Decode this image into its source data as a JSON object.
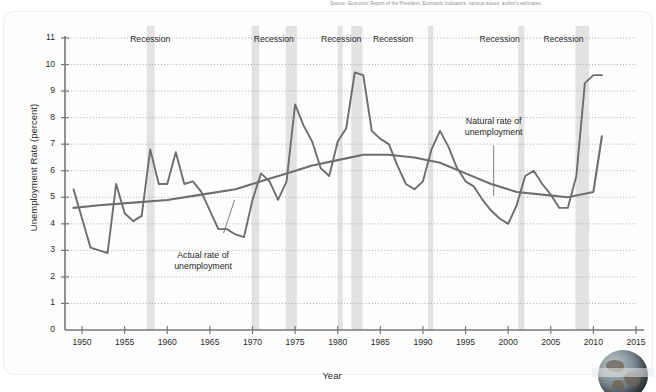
{
  "source_note": "Source: Economic Report of the President, Economic Indicators, various issues; author's estimates.",
  "annotations": {
    "actual": "Actual rate of\nunemployment",
    "actual_line1": "Actual rate of",
    "actual_line2": "unemployment",
    "natural_line1": "Natural rate of",
    "natural_line2": "unemployment"
  },
  "recession_label": "Recession",
  "decor": {
    "globe": "globe-image"
  },
  "chart_data": {
    "type": "line",
    "title": "",
    "xlabel": "Year",
    "ylabel": "Unemployment Rate (percent)",
    "xlim": [
      1948,
      2015
    ],
    "ylim": [
      0,
      11
    ],
    "xticks": [
      1950,
      1955,
      1960,
      1965,
      1970,
      1975,
      1980,
      1985,
      1990,
      1995,
      2000,
      2005,
      2010,
      2015
    ],
    "yticks": [
      0,
      1,
      2,
      3,
      4,
      5,
      6,
      7,
      8,
      9,
      10,
      11
    ],
    "grid": "horizontal-dotted",
    "legend": "none (inline annotations)",
    "colors": {
      "actual": "#6e6e6e",
      "natural": "#6e6e6e",
      "recession_band": "#e2e2e2",
      "grid": "#9a9a9a"
    },
    "series": [
      {
        "name": "Actual rate of unemployment",
        "x": [
          1949,
          1950,
          1951,
          1952,
          1953,
          1954,
          1955,
          1956,
          1957,
          1958,
          1959,
          1960,
          1961,
          1962,
          1963,
          1964,
          1965,
          1966,
          1967,
          1968,
          1969,
          1970,
          1971,
          1972,
          1973,
          1974,
          1975,
          1976,
          1977,
          1978,
          1979,
          1980,
          1981,
          1982,
          1983,
          1984,
          1985,
          1986,
          1987,
          1988,
          1989,
          1990,
          1991,
          1992,
          1993,
          1994,
          1995,
          1996,
          1997,
          1998,
          1999,
          2000,
          2001,
          2002,
          2003,
          2004,
          2005,
          2006,
          2007,
          2008,
          2009,
          2010,
          2011
        ],
        "values": [
          5.3,
          4.2,
          3.1,
          3.0,
          2.9,
          5.5,
          4.4,
          4.1,
          4.3,
          6.8,
          5.5,
          5.5,
          6.7,
          5.5,
          5.6,
          5.2,
          4.5,
          3.8,
          3.8,
          3.6,
          3.5,
          4.9,
          5.9,
          5.6,
          4.9,
          5.6,
          8.5,
          7.7,
          7.1,
          6.1,
          5.8,
          7.1,
          7.6,
          9.7,
          9.6,
          7.5,
          7.2,
          7.0,
          6.2,
          5.5,
          5.3,
          5.6,
          6.8,
          7.5,
          6.9,
          6.1,
          5.6,
          5.4,
          4.9,
          4.5,
          4.2,
          4.0,
          4.7,
          5.8,
          6.0,
          5.5,
          5.1,
          4.6,
          4.6,
          5.8,
          9.3,
          9.6,
          9.6
        ]
      },
      {
        "name": "Natural rate of unemployment",
        "x": [
          1949,
          1952,
          1956,
          1960,
          1964,
          1968,
          1971,
          1974,
          1977,
          1980,
          1983,
          1986,
          1989,
          1992,
          1995,
          1998,
          2001,
          2004,
          2007,
          2010,
          2011
        ],
        "values": [
          4.6,
          4.7,
          4.8,
          4.9,
          5.1,
          5.3,
          5.6,
          5.9,
          6.2,
          6.4,
          6.6,
          6.6,
          6.5,
          6.3,
          5.9,
          5.5,
          5.2,
          5.1,
          5.0,
          5.2,
          7.3
        ]
      }
    ],
    "recessions": [
      {
        "label": "Recession",
        "start": 1957.6,
        "end": 1958.5
      },
      {
        "label": "Recession",
        "start": 1969.9,
        "end": 1970.8
      },
      {
        "label": "Recession",
        "start": 1973.9,
        "end": 1975.2
      },
      {
        "label": "Recession",
        "start": 1980.0,
        "end": 1980.6
      },
      {
        "label": "Recession",
        "start": 1981.6,
        "end": 1982.9
      },
      {
        "label": "Recession",
        "start": 1990.6,
        "end": 1991.2
      },
      {
        "label": "Recession",
        "start": 2001.2,
        "end": 2001.9
      },
      {
        "label": "Recession",
        "start": 2007.9,
        "end": 2009.5
      }
    ],
    "recession_text_positions": [
      1958,
      1972.5,
      1980.4,
      1986.5,
      1999,
      2006.5
    ]
  }
}
